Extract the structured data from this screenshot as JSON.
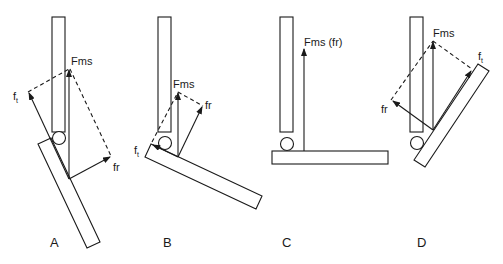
{
  "figure": {
    "panels": [
      {
        "id": "A",
        "label": "A",
        "force_labels": {
          "resultant": "Fms",
          "tangential": "f",
          "tangential_sub": "t",
          "radial": "fr"
        }
      },
      {
        "id": "B",
        "label": "B",
        "force_labels": {
          "resultant": "Fms",
          "tangential": "f",
          "tangential_sub": "t",
          "radial": "fr"
        }
      },
      {
        "id": "C",
        "label": "C",
        "force_labels": {
          "resultant": "Fms (fr)"
        }
      },
      {
        "id": "D",
        "label": "D",
        "force_labels": {
          "resultant": "Fms",
          "tangential": "f",
          "tangential_sub": "t",
          "radial": "fr"
        }
      }
    ],
    "colors": {
      "line": "#1a1a1a",
      "background": "#ffffff"
    }
  }
}
